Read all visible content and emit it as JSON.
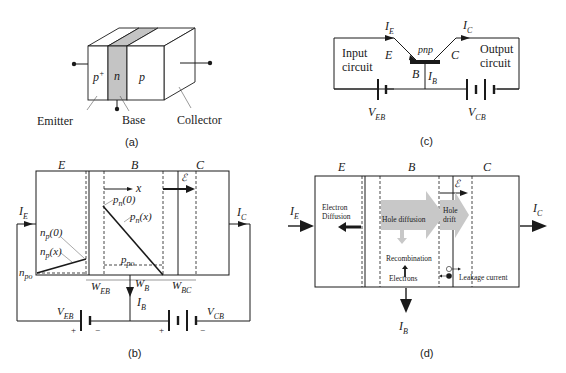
{
  "figure": {
    "panels": [
      {
        "id": "a",
        "caption": "(a)",
        "description": "3-D block of pnp transistor",
        "regions": [
          "p+",
          "n",
          "p"
        ],
        "region_superscript": "+",
        "terminals": [
          "Emitter",
          "Base",
          "Collector"
        ]
      },
      {
        "id": "b",
        "caption": "(b)",
        "region_labels": [
          "E",
          "B",
          "C"
        ],
        "field_label": "ℰ",
        "x_axis_label": "x",
        "concentration_labels": {
          "pn0": {
            "main": "p",
            "sub": "n",
            "arg": "(0)"
          },
          "pnx": {
            "main": "p",
            "sub": "n",
            "arg": "(x)"
          },
          "ppo": {
            "main": "p",
            "sub": "po"
          },
          "np0": {
            "main": "n",
            "sub": "p",
            "arg": "(0)"
          },
          "npx": {
            "main": "n",
            "sub": "p",
            "arg": "(x)"
          },
          "npo": {
            "main": "n",
            "sub": "po"
          }
        },
        "widths": [
          {
            "main": "W",
            "sub": "EB"
          },
          {
            "main": "W",
            "sub": "B"
          },
          {
            "main": "W",
            "sub": "BC"
          }
        ],
        "currents": {
          "IE": {
            "main": "I",
            "sub": "E"
          },
          "IC": {
            "main": "I",
            "sub": "C"
          },
          "IB": {
            "main": "I",
            "sub": "B"
          }
        },
        "sources": {
          "VEB": {
            "main": "V",
            "sub": "EB",
            "plus": "+",
            "minus": "−"
          },
          "VCB": {
            "main": "V",
            "sub": "CB",
            "plus": "+",
            "minus": "−"
          }
        }
      },
      {
        "id": "c",
        "caption": "(c)",
        "device_label": "pnp",
        "terminals": [
          "E",
          "B",
          "C"
        ],
        "input_circuit": [
          "Input",
          "circuit"
        ],
        "output_circuit": [
          "Output",
          "circuit"
        ],
        "currents": {
          "IE": {
            "main": "I",
            "sub": "E"
          },
          "IC": {
            "main": "I",
            "sub": "C"
          },
          "IB": {
            "main": "I",
            "sub": "B"
          }
        },
        "sources": {
          "VEB": {
            "main": "V",
            "sub": "EB"
          },
          "VCB": {
            "main": "V",
            "sub": "CB"
          }
        }
      },
      {
        "id": "d",
        "caption": "(d)",
        "region_labels": [
          "E",
          "B",
          "C"
        ],
        "field_label": "ℰ",
        "electron_diffusion": [
          "Electron",
          "Diffusion"
        ],
        "hole_diffusion": "Hole diffusion",
        "hole_drift": [
          "Hole",
          "drift"
        ],
        "recombination": "Recombination",
        "electrons": "Electrons",
        "leakage_current": "Leakage current",
        "currents": {
          "IE": {
            "main": "I",
            "sub": "E"
          },
          "IC": {
            "main": "I",
            "sub": "C"
          },
          "IB": {
            "main": "I",
            "sub": "B"
          }
        },
        "arrow_fill": "#c8c8c8",
        "base_fill": "#c4c4c4"
      }
    ]
  }
}
